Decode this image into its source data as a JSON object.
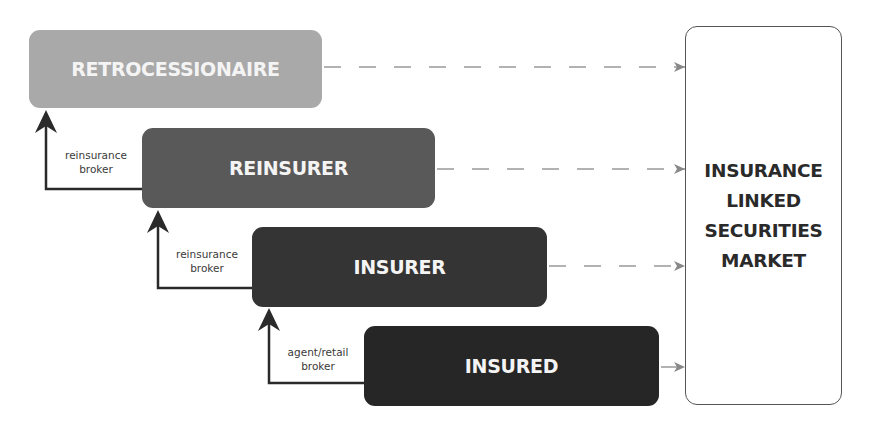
{
  "diagram": {
    "entities": [
      {
        "id": "retrocessionaire",
        "label": "RETROCESSIONAIRE",
        "color": "#a9a9a9"
      },
      {
        "id": "reinsurer",
        "label": "REINSURER",
        "color": "#595959"
      },
      {
        "id": "insurer",
        "label": "INSURER",
        "color": "#343434"
      },
      {
        "id": "insured",
        "label": "INSURED",
        "color": "#262626"
      }
    ],
    "brokers": [
      {
        "from": "reinsurer",
        "to": "retrocessionaire",
        "line1": "reinsurance",
        "line2": "broker"
      },
      {
        "from": "insurer",
        "to": "reinsurer",
        "line1": "reinsurance",
        "line2": "broker"
      },
      {
        "from": "insured",
        "to": "insurer",
        "line1": "agent/retail",
        "line2": "broker"
      }
    ],
    "market": {
      "lines": [
        "INSURANCE",
        "LINKED",
        "SECURITIES",
        "MARKET"
      ]
    },
    "connections": [
      {
        "from": "retrocessionaire",
        "to": "market",
        "style": "dashed"
      },
      {
        "from": "reinsurer",
        "to": "market",
        "style": "dashed"
      },
      {
        "from": "insurer",
        "to": "market",
        "style": "dashed"
      },
      {
        "from": "insured",
        "to": "market",
        "style": "dashed"
      }
    ]
  }
}
